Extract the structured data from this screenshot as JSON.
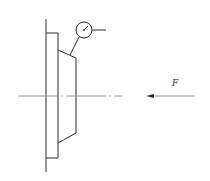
{
  "diagram": {
    "title": "",
    "colors": {
      "line": "#2a2a2a",
      "centerline": "#8a8a8a",
      "background": "#ffffff"
    },
    "force": {
      "label": "F",
      "direction": "left"
    },
    "components": [
      {
        "name": "shaft-line",
        "type": "line"
      },
      {
        "name": "flange-plate",
        "type": "rectangle"
      },
      {
        "name": "tapered-hub",
        "type": "polygon"
      },
      {
        "name": "dial-indicator",
        "type": "gauge"
      },
      {
        "name": "centerline",
        "type": "dash-dot line"
      },
      {
        "name": "force-arrow",
        "type": "arrow"
      }
    ]
  }
}
